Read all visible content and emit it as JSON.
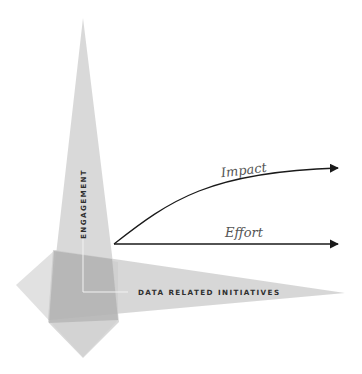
{
  "diagram": {
    "vertical_axis_label": "ENGAGEMENT",
    "horizontal_axis_label": "DATA RELATED INITIATIVES",
    "arrows": [
      {
        "label": "Impact",
        "shape": "curved-upward"
      },
      {
        "label": "Effort",
        "shape": "straight-horizontal"
      }
    ],
    "colors": {
      "light_gray": "#d6d6d6",
      "mid_gray": "#c4c4c4",
      "overlap_gray": "#a9a9a9",
      "arrow": "#1a1a1a",
      "guide_line": "#f2f2f2"
    }
  }
}
